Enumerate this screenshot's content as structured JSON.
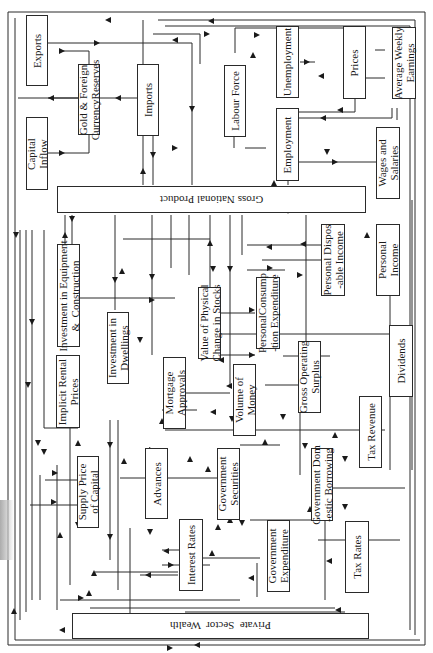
{
  "diagram": {
    "orientation": "rotated 90 degrees",
    "nodes": [
      {
        "id": "exports",
        "label": "Exports"
      },
      {
        "id": "gold_reserves",
        "label": "Gold & Foreign\nCurrencyReserves"
      },
      {
        "id": "imports",
        "label": "Imports"
      },
      {
        "id": "labour_force",
        "label": "Labour Force"
      },
      {
        "id": "unemployment",
        "label": "Unemployment"
      },
      {
        "id": "prices",
        "label": "Prices"
      },
      {
        "id": "avg_weekly_earnings",
        "label": "Average Weekly\nEarnings"
      },
      {
        "id": "capital_inflow",
        "label": "Capital\nInflow"
      },
      {
        "id": "employment",
        "label": "Employment"
      },
      {
        "id": "wages_salaries",
        "label": "Wages and\nSalaries"
      },
      {
        "id": "gnp",
        "label": "Gross National Product"
      },
      {
        "id": "personal_disposable_income",
        "label": "Personal Dispos\n-able Income"
      },
      {
        "id": "personal_income",
        "label": "Personal\nIncome"
      },
      {
        "id": "investment_equipment",
        "label": "Investment in Equipment\n&  Construction"
      },
      {
        "id": "investment_dwellings",
        "label": "Investment in\nDwellings"
      },
      {
        "id": "value_physical_change_stocks",
        "label": "Value of Physical\nChange in Stocks"
      },
      {
        "id": "personal_consumption",
        "label": "PersonalConsump\n-tion Expenditure"
      },
      {
        "id": "implicit_rental_prices",
        "label": "Implicit Rental\nPrices"
      },
      {
        "id": "mortgage_approvals",
        "label": "Mortgage\nApprovals"
      },
      {
        "id": "volume_of_money",
        "label": "Volume of\nMoney"
      },
      {
        "id": "gross_operating_surplus",
        "label": "Gross Operating\nSurplus"
      },
      {
        "id": "dividends",
        "label": "Dividends"
      },
      {
        "id": "supply_price_capital",
        "label": "Supply Price\nof Capital"
      },
      {
        "id": "advances",
        "label": "Advances"
      },
      {
        "id": "government_securities",
        "label": "Government\nSecurities"
      },
      {
        "id": "government_domestic_borrowing",
        "label": "Government Dom\n-estic Borrowing"
      },
      {
        "id": "tax_revenue",
        "label": "Tax Revenue"
      },
      {
        "id": "interest_rates",
        "label": "Interest Rates"
      },
      {
        "id": "government_expenditure",
        "label": "Government\nExpenditure"
      },
      {
        "id": "tax_rates",
        "label": "Tax Rates"
      },
      {
        "id": "private_sector_wealth",
        "label": "Private  Sector  Wealth"
      }
    ]
  }
}
